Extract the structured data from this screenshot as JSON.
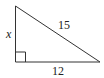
{
  "diagram": {
    "type": "right-triangle",
    "labels": {
      "vertical_leg": "x",
      "hypotenuse": "15",
      "horizontal_leg": "12"
    },
    "right_angle_marker": true
  }
}
